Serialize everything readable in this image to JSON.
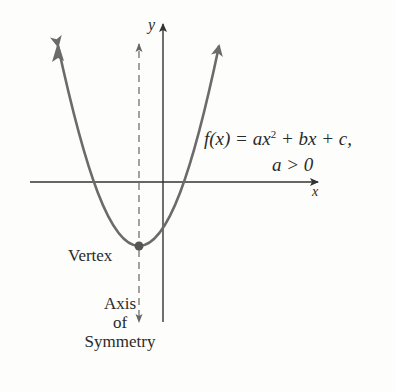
{
  "figure": {
    "equation_line1_prefix": "f(x) = ax",
    "equation_exponent": "2",
    "equation_line1_suffix": " + bx + c,",
    "equation_line2": "a > 0",
    "x_axis_label": "x",
    "y_axis_label": "y",
    "vertex_label": "Vertex",
    "axis_label_line1": "Axis",
    "axis_label_line2": "of",
    "axis_label_line3": "Symmetry"
  },
  "colors": {
    "curve": "#6b6b6b",
    "axes": "#333333",
    "vertex_dot": "#555555",
    "background": "#fdfdfb"
  }
}
